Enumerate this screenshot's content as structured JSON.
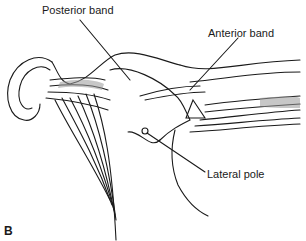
{
  "figure": {
    "panel_label": "B",
    "labels": {
      "posterior_band": "Posterior band",
      "anterior_band": "Anterior band",
      "lateral_pole": "Lateral pole"
    },
    "colors": {
      "line": "#1a1a1a",
      "shade": "#9a9a9a",
      "background": "#ffffff"
    }
  }
}
